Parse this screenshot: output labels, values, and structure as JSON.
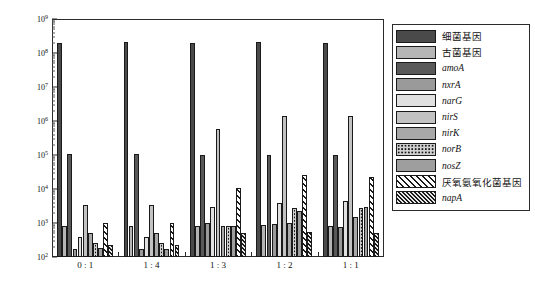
{
  "axes": {
    "ylabel": "基因丰度(拷贝以数/g)",
    "yticks": [
      "10⁹",
      "10⁸",
      "10⁷",
      "10⁶",
      "10⁵",
      "10⁴",
      "10³",
      "10²"
    ],
    "ytick_exponents": [
      9,
      8,
      7,
      6,
      5,
      4,
      3,
      2
    ],
    "xlabel": "",
    "xticks": [
      "0 : 1",
      "1 : 4",
      "1 : 3",
      "1 : 2",
      "1 : 1"
    ]
  },
  "legend": {
    "position": "right-outside",
    "items": [
      {
        "label": "细菌基因",
        "italic": false,
        "fill": "#4a4a4a",
        "pattern": "solid"
      },
      {
        "label": "古菌基因",
        "italic": false,
        "fill": "#b5b5b5",
        "pattern": "solid"
      },
      {
        "label": "amoA",
        "italic": true,
        "fill": "#595959",
        "pattern": "solid"
      },
      {
        "label": "nxrA",
        "italic": true,
        "fill": "#9a9a9a",
        "pattern": "solid"
      },
      {
        "label": "narG",
        "italic": true,
        "fill": "#e0e0e0",
        "pattern": "solid"
      },
      {
        "label": "nirS",
        "italic": true,
        "fill": "#c2c2c2",
        "pattern": "solid"
      },
      {
        "label": "nirK",
        "italic": true,
        "fill": "#a8a8a8",
        "pattern": "solid"
      },
      {
        "label": "norB",
        "italic": true,
        "fill": "#d0d0d0",
        "pattern": "dots"
      },
      {
        "label": "nosZ",
        "italic": true,
        "fill": "#9e9e9e",
        "pattern": "solid"
      },
      {
        "label": "厌氧氨氧化菌基因",
        "italic": false,
        "fill": "#ffffff",
        "pattern": "hatch-wide"
      },
      {
        "label": "napA",
        "italic": true,
        "fill": "#bdbdbd",
        "pattern": "hatch-dense"
      }
    ]
  },
  "chart_data": {
    "type": "bar",
    "title": "",
    "xlabel": "",
    "ylabel": "基因丰度(拷贝以数/g)",
    "yscale": "log",
    "ylim": [
      100,
      1000000000
    ],
    "grid": false,
    "legend_position": "right",
    "categories": [
      "0 : 1",
      "1 : 4",
      "1 : 3",
      "1 : 2",
      "1 : 1"
    ],
    "series": [
      {
        "name": "细菌基因",
        "values": [
          200000000.0,
          210000000.0,
          200000000.0,
          210000000.0,
          200000000.0
        ]
      },
      {
        "name": "古菌基因",
        "values": [
          800.0,
          800.0,
          800.0,
          850.0,
          800.0
        ]
      },
      {
        "name": "amoA",
        "values": [
          105000.0,
          105000.0,
          100000.0,
          100000.0,
          100000.0
        ]
      },
      {
        "name": "nxrA",
        "values": [
          170.0,
          170.0,
          1000.0,
          950.0,
          780.0
        ]
      },
      {
        "name": "narG",
        "values": [
          400.0,
          400.0,
          3000.0,
          3800.0,
          4300.0
        ]
      },
      {
        "name": "nirS",
        "values": [
          3400.0,
          3400.0,
          580000.0,
          1400000.0,
          1400000.0
        ]
      },
      {
        "name": "nirK",
        "values": [
          500.0,
          500.0,
          800.0,
          1000.0,
          1500.0
        ]
      },
      {
        "name": "norB",
        "values": [
          260.0,
          260.0,
          800.0,
          2700.0,
          2700.0
        ]
      },
      {
        "name": "nosZ",
        "values": [
          180.0,
          170.0,
          800.0,
          2200.0,
          3000.0
        ]
      },
      {
        "name": "厌氧氨氧化菌基因",
        "values": [
          1000.0,
          1000.0,
          10500.0,
          26000.0,
          22000.0
        ]
      },
      {
        "name": "napA",
        "values": [
          230.0,
          230.0,
          500.0,
          550.0,
          500.0
        ]
      }
    ]
  }
}
